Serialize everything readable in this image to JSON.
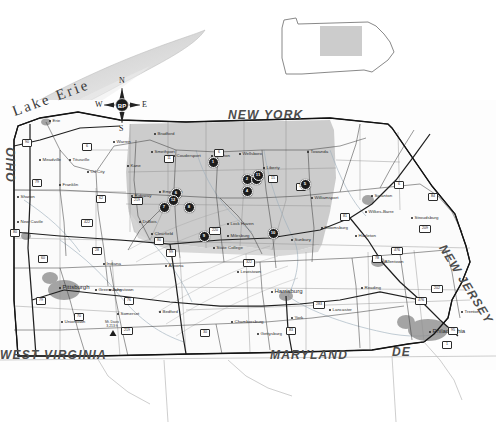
{
  "figure": {
    "kind": "reference-map",
    "title_visible": false,
    "background_color": "#ffffff",
    "study_area_fill": "#c9c9c9",
    "marker_color": "#1c1c1c",
    "marker_label_color": "#ffffff",
    "urban_fill": "#8f8f8f",
    "road_color": "#2b2b2b",
    "border_color": "#1a1a1a"
  },
  "inset": {
    "name": "pennsylvania-locator-inset",
    "outline_color": "#6b6b6b",
    "highlight_fill": "#c9c9c9",
    "highlight_label": ""
  },
  "compass": {
    "name": "compass-rose",
    "center_label": "BP",
    "north": "N",
    "south": "S",
    "east": "E",
    "west": "W"
  },
  "water": {
    "lake_label": "Lake Erie",
    "fill": "#e9e9e9"
  },
  "state_labels": [
    {
      "text": "NEW YORK",
      "x": 228,
      "y": 108,
      "size": 12,
      "rotate": 0
    },
    {
      "text": "OHIO",
      "x": 4,
      "y": 182,
      "size": 12,
      "rotate": -90
    },
    {
      "text": "WEST VIRGINIA",
      "x": 0,
      "y": 348,
      "size": 12,
      "rotate": 0
    },
    {
      "text": "MARYLAND",
      "x": 270,
      "y": 348,
      "size": 12,
      "rotate": 0
    },
    {
      "text": "NEW JERSEY",
      "x": 448,
      "y": 242,
      "size": 12,
      "rotate": 58
    },
    {
      "text": "DE",
      "x": 392,
      "y": 345,
      "size": 12,
      "rotate": 0
    }
  ],
  "cities": [
    {
      "name": "Erie",
      "x": 50,
      "y": 121,
      "big": false
    },
    {
      "name": "Meadville",
      "x": 40,
      "y": 160,
      "big": false
    },
    {
      "name": "Franklin",
      "x": 60,
      "y": 185,
      "big": false
    },
    {
      "name": "Sharon",
      "x": 18,
      "y": 197,
      "big": false
    },
    {
      "name": "New Castle",
      "x": 18,
      "y": 222,
      "big": false
    },
    {
      "name": "Titusville",
      "x": 70,
      "y": 160,
      "big": false
    },
    {
      "name": "Oil City",
      "x": 88,
      "y": 172,
      "big": false
    },
    {
      "name": "Warren",
      "x": 114,
      "y": 142,
      "big": false
    },
    {
      "name": "Bradford",
      "x": 155,
      "y": 134,
      "big": false
    },
    {
      "name": "Coudersport",
      "x": 174,
      "y": 156,
      "big": false
    },
    {
      "name": "Galeton",
      "x": 212,
      "y": 156,
      "big": false
    },
    {
      "name": "Towanda",
      "x": 308,
      "y": 152,
      "big": false
    },
    {
      "name": "Liberty",
      "x": 264,
      "y": 168,
      "big": false
    },
    {
      "name": "Williamsport",
      "x": 312,
      "y": 198,
      "big": false
    },
    {
      "name": "Clearfield",
      "x": 152,
      "y": 234,
      "big": false
    },
    {
      "name": "Lock Haven",
      "x": 228,
      "y": 224,
      "big": false
    },
    {
      "name": "Milesburg",
      "x": 228,
      "y": 236,
      "big": false
    },
    {
      "name": "State College",
      "x": 214,
      "y": 248,
      "big": false
    },
    {
      "name": "DuBois",
      "x": 140,
      "y": 222,
      "big": false
    },
    {
      "name": "Altoona",
      "x": 166,
      "y": 266,
      "big": false
    },
    {
      "name": "Johnstown",
      "x": 110,
      "y": 290,
      "big": false
    },
    {
      "name": "Pittsburgh",
      "x": 60,
      "y": 288,
      "big": true
    },
    {
      "name": "Greensburg",
      "x": 96,
      "y": 290,
      "big": false
    },
    {
      "name": "Indiana",
      "x": 104,
      "y": 264,
      "big": false
    },
    {
      "name": "Uniontown",
      "x": 62,
      "y": 322,
      "big": false
    },
    {
      "name": "Harrisburg",
      "x": 272,
      "y": 292,
      "big": true
    },
    {
      "name": "Lewistown",
      "x": 238,
      "y": 272,
      "big": false
    },
    {
      "name": "Sunbury",
      "x": 292,
      "y": 240,
      "big": false
    },
    {
      "name": "Bloomsburg",
      "x": 322,
      "y": 228,
      "big": false
    },
    {
      "name": "Hazleton",
      "x": 356,
      "y": 236,
      "big": false
    },
    {
      "name": "Scranton",
      "x": 372,
      "y": 196,
      "big": false
    },
    {
      "name": "Wilkes-Barre",
      "x": 366,
      "y": 212,
      "big": false
    },
    {
      "name": "Stroudsburg",
      "x": 412,
      "y": 218,
      "big": false
    },
    {
      "name": "Allentown",
      "x": 382,
      "y": 262,
      "big": false
    },
    {
      "name": "Reading",
      "x": 362,
      "y": 288,
      "big": false
    },
    {
      "name": "Lancaster",
      "x": 330,
      "y": 310,
      "big": false
    },
    {
      "name": "York",
      "x": 292,
      "y": 318,
      "big": false
    },
    {
      "name": "Chambersburg",
      "x": 232,
      "y": 322,
      "big": false
    },
    {
      "name": "Gettysburg",
      "x": 258,
      "y": 334,
      "big": false
    },
    {
      "name": "Somerset",
      "x": 118,
      "y": 314,
      "big": false
    },
    {
      "name": "Bedford",
      "x": 160,
      "y": 312,
      "big": false
    },
    {
      "name": "Philadelphia",
      "x": 430,
      "y": 332,
      "big": true
    },
    {
      "name": "Trenton",
      "x": 462,
      "y": 312,
      "big": false
    },
    {
      "name": "Wellsboro",
      "x": 240,
      "y": 154,
      "big": false
    },
    {
      "name": "Emporium",
      "x": 160,
      "y": 192,
      "big": false
    },
    {
      "name": "Ridgway",
      "x": 132,
      "y": 196,
      "big": false
    },
    {
      "name": "Kane",
      "x": 128,
      "y": 166,
      "big": false
    },
    {
      "name": "Smethport",
      "x": 152,
      "y": 152,
      "big": false
    }
  ],
  "peak": {
    "name": "Mt. Davis",
    "elevation": "3,213 ft",
    "x": 110,
    "y": 322
  },
  "highways": [
    {
      "label": "90",
      "x": 26,
      "y": 142
    },
    {
      "label": "79",
      "x": 36,
      "y": 182
    },
    {
      "label": "80",
      "x": 14,
      "y": 232
    },
    {
      "label": "6",
      "x": 86,
      "y": 146
    },
    {
      "label": "6",
      "x": 218,
      "y": 152
    },
    {
      "label": "15",
      "x": 272,
      "y": 178
    },
    {
      "label": "220",
      "x": 214,
      "y": 230
    },
    {
      "label": "80",
      "x": 158,
      "y": 240
    },
    {
      "label": "99",
      "x": 170,
      "y": 252
    },
    {
      "label": "76",
      "x": 128,
      "y": 300
    },
    {
      "label": "70",
      "x": 78,
      "y": 316
    },
    {
      "label": "79",
      "x": 40,
      "y": 300
    },
    {
      "label": "81",
      "x": 344,
      "y": 216
    },
    {
      "label": "78",
      "x": 376,
      "y": 258
    },
    {
      "label": "476",
      "x": 396,
      "y": 250
    },
    {
      "label": "83",
      "x": 290,
      "y": 330
    },
    {
      "label": "283",
      "x": 318,
      "y": 304
    },
    {
      "label": "95",
      "x": 452,
      "y": 330
    },
    {
      "label": "476",
      "x": 420,
      "y": 300
    },
    {
      "label": "30",
      "x": 204,
      "y": 332
    },
    {
      "label": "219",
      "x": 126,
      "y": 330
    },
    {
      "label": "219",
      "x": 136,
      "y": 200
    },
    {
      "label": "322",
      "x": 248,
      "y": 262
    },
    {
      "label": "11",
      "x": 300,
      "y": 186
    },
    {
      "label": "11",
      "x": 168,
      "y": 158
    },
    {
      "label": "62",
      "x": 100,
      "y": 198
    },
    {
      "label": "422",
      "x": 86,
      "y": 222
    },
    {
      "label": "60",
      "x": 42,
      "y": 258
    },
    {
      "label": "28",
      "x": 96,
      "y": 250
    },
    {
      "label": "6",
      "x": 398,
      "y": 184
    },
    {
      "label": "84",
      "x": 432,
      "y": 196
    },
    {
      "label": "209",
      "x": 424,
      "y": 228
    },
    {
      "label": "202",
      "x": 436,
      "y": 288
    },
    {
      "label": "1",
      "x": 446,
      "y": 344
    }
  ],
  "markers": {
    "shape": "filled-circle",
    "count": 12,
    "items": [
      {
        "id": 1,
        "label": "1",
        "x": 212,
        "y": 161
      },
      {
        "id": 2,
        "label": "2",
        "x": 246,
        "y": 178
      },
      {
        "id": 3,
        "label": "3",
        "x": 255,
        "y": 178
      },
      {
        "id": 4,
        "label": "4",
        "x": 246,
        "y": 190
      },
      {
        "id": 5,
        "label": "5",
        "x": 304,
        "y": 183
      },
      {
        "id": 6,
        "label": "6",
        "x": 175,
        "y": 192
      },
      {
        "id": 7,
        "label": "7",
        "x": 163,
        "y": 206
      },
      {
        "id": 8,
        "label": "8",
        "x": 188,
        "y": 206
      },
      {
        "id": 9,
        "label": "9",
        "x": 203,
        "y": 235
      },
      {
        "id": 10,
        "label": "10",
        "x": 272,
        "y": 232
      },
      {
        "id": 11,
        "label": "11",
        "x": 257,
        "y": 174
      },
      {
        "id": 12,
        "label": "12",
        "x": 172,
        "y": 199
      }
    ]
  }
}
